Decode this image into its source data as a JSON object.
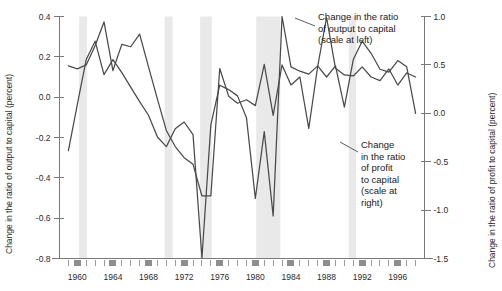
{
  "chart_data": {
    "type": "line",
    "title": "",
    "xlabel": "",
    "ylabel": "Change in the ratio of output to capital (percent)",
    "y2label": "Change in the ratio of profit to capital (percent)",
    "xlim": [
      1958,
      1999
    ],
    "ylim": [
      -0.8,
      0.4
    ],
    "y2lim": [
      -1.5,
      1.0
    ],
    "grid": false,
    "legend_position": "inline-annotations",
    "yticks": [
      0.4,
      0.2,
      0.0,
      -0.2,
      -0.4,
      -0.6,
      -0.8
    ],
    "ytick_labels": [
      "0.4",
      "0.2",
      "0.0",
      "-0.2",
      "-0.4",
      "-0.6",
      "-0.8"
    ],
    "y2ticks": [
      1.0,
      0.5,
      0.0,
      -0.5,
      -1.0,
      -1.5
    ],
    "y2tick_labels": [
      "1.0",
      "0.5",
      "0.0",
      "-0.5",
      "-1.0",
      "-1.5"
    ],
    "xticks": [
      1960,
      1964,
      1968,
      1972,
      1976,
      1980,
      1984,
      1988,
      1992,
      1996
    ],
    "xtick_labels": [
      "1960",
      "1964",
      "1968",
      "1972",
      "1976",
      "1980",
      "1984",
      "1988",
      "1992",
      "1996"
    ],
    "xticks_minor": [
      1959,
      1961,
      1962,
      1963,
      1965,
      1966,
      1967,
      1969,
      1970,
      1971,
      1973,
      1974,
      1975,
      1977,
      1978,
      1979,
      1981,
      1982,
      1983,
      1985,
      1986,
      1987,
      1989,
      1990,
      1991,
      1993,
      1994,
      1995,
      1997,
      1998
    ],
    "shaded_bands": [
      {
        "label": "recession",
        "start": 1960.2,
        "end": 1961.1
      },
      {
        "label": "recession",
        "start": 1969.8,
        "end": 1970.7
      },
      {
        "label": "recession",
        "start": 1973.8,
        "end": 1975.1
      },
      {
        "label": "recession",
        "start": 1980.1,
        "end": 1982.8
      },
      {
        "label": "recession",
        "start": 1990.5,
        "end": 1991.3
      }
    ],
    "series": [
      {
        "name": "Change in the ratio of output to capital (scale at left)",
        "axis": "left",
        "color": "#4a4a4a",
        "x": [
          1959,
          1960,
          1961,
          1962,
          1963,
          1964,
          1965,
          1966,
          1967,
          1968,
          1969,
          1970,
          1971,
          1972,
          1973,
          1974,
          1975,
          1976,
          1977,
          1978,
          1979,
          1980,
          1981,
          1982,
          1983,
          1984,
          1985,
          1986,
          1987,
          1988,
          1989,
          1990,
          1991,
          1992,
          1993,
          1994,
          1995,
          1996,
          1997,
          1998
        ],
        "values": [
          0.155,
          0.14,
          0.16,
          0.255,
          0.373,
          0.132,
          0.262,
          0.25,
          0.313,
          0.15,
          -0.01,
          -0.165,
          -0.245,
          -0.3,
          -0.333,
          -0.49,
          -0.49,
          0.142,
          0.005,
          -0.03,
          -0.013,
          -0.042,
          0.163,
          -0.09,
          0.16,
          0.06,
          0.1,
          -0.155,
          0.152,
          0.395,
          0.143,
          0.11,
          0.105,
          0.15,
          0.1,
          0.082,
          0.14,
          0.06,
          0.12,
          0.1
        ]
      },
      {
        "name": "Change in the ratio of profit to capital (scale at right)",
        "axis": "right",
        "color": "#4a4a4a",
        "x": [
          1959,
          1960,
          1961,
          1962,
          1963,
          1964,
          1965,
          1966,
          1967,
          1968,
          1969,
          1970,
          1971,
          1972,
          1973,
          1974,
          1975,
          1976,
          1977,
          1978,
          1979,
          1980,
          1981,
          1982,
          1983,
          1984,
          1985,
          1986,
          1987,
          1988,
          1989,
          1990,
          1991,
          1992,
          1993,
          1994,
          1995,
          1996,
          1997,
          1998
        ],
        "values": [
          -0.385,
          0.09,
          0.555,
          0.745,
          0.4,
          0.555,
          0.42,
          0.27,
          0.12,
          -0.02,
          -0.245,
          -0.345,
          -0.16,
          -0.09,
          -0.22,
          -1.495,
          -0.12,
          0.29,
          0.245,
          0.18,
          -0.045,
          -0.88,
          -0.19,
          -1.06,
          1.0,
          0.48,
          0.435,
          0.405,
          0.49,
          0.375,
          0.49,
          0.065,
          0.555,
          0.745,
          0.62,
          0.455,
          0.425,
          0.545,
          0.48,
          0.0
        ]
      }
    ],
    "annotations": [
      {
        "id": "output-annotation",
        "lines": [
          "Change in the ratio",
          "of output to capital",
          "(scale at left)"
        ],
        "x": 318,
        "y": 20
      },
      {
        "id": "profit-annotation",
        "lines": [
          "Change",
          "in the ratio",
          "of profit",
          "to capital",
          "(scale at",
          "right)"
        ],
        "x": 361,
        "y": 148
      }
    ]
  },
  "axes": {
    "left_title": "Change in the ratio of output to capital (percent)",
    "right_title": "Change in the ratio of profit to capital (percent)"
  }
}
